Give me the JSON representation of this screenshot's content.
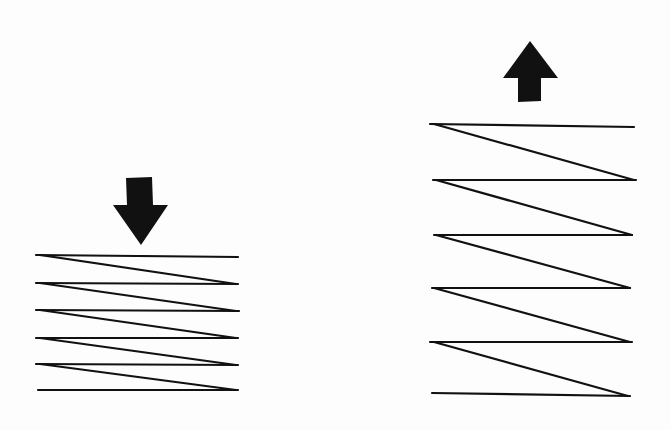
{
  "diagram": {
    "colors": {
      "background": "#fdfdfd",
      "ink": "#111111"
    },
    "left_spring": {
      "state": "compressed",
      "arrow": "down-arrow",
      "x_left": 36,
      "x_right": 238,
      "coil_y": [
        255,
        283,
        310,
        338,
        364,
        390
      ]
    },
    "right_spring": {
      "state": "extended",
      "arrow": "up-arrow",
      "x_left": 430,
      "x_right": 635,
      "coil_y": [
        124,
        180,
        235,
        288,
        342,
        395
      ]
    }
  }
}
